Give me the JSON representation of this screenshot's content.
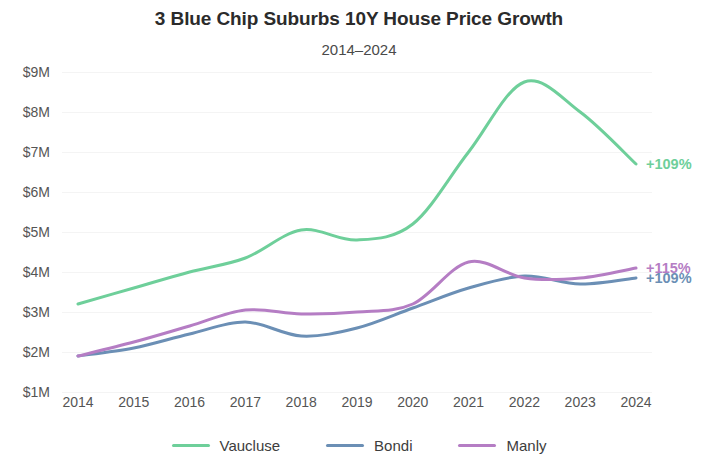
{
  "chart_data": {
    "type": "line",
    "title": "3 Blue Chip Suburbs 10Y House Price Growth",
    "subtitle": "2014–2024",
    "xlabel": "",
    "ylabel": "",
    "x": [
      2014,
      2015,
      2016,
      2017,
      2018,
      2019,
      2020,
      2021,
      2022,
      2023,
      2024
    ],
    "categories": [
      "2014",
      "2015",
      "2016",
      "2017",
      "2018",
      "2019",
      "2020",
      "2021",
      "2022",
      "2023",
      "2024"
    ],
    "ylim": [
      1,
      9
    ],
    "y_unit": "$M",
    "y_ticks": [
      9,
      8,
      7,
      6,
      5,
      4,
      3,
      2,
      1
    ],
    "y_tick_labels": [
      "$9M",
      "$8M",
      "$7M",
      "$6M",
      "$5M",
      "$4M",
      "$3M",
      "$2M",
      "$1M"
    ],
    "grid": true,
    "grid_color": "#f4f4f4",
    "legend_position": "bottom",
    "series": [
      {
        "name": "Vaucluse",
        "color": "#6ecf9a",
        "values": [
          3.2,
          3.6,
          4.0,
          4.35,
          5.05,
          4.8,
          5.2,
          7.0,
          8.75,
          8.0,
          6.7
        ],
        "end_label": "+109%"
      },
      {
        "name": "Bondi",
        "color": "#6b8fb5",
        "values": [
          1.9,
          2.1,
          2.45,
          2.75,
          2.4,
          2.6,
          3.1,
          3.6,
          3.9,
          3.7,
          3.85
        ],
        "end_label": "+109%"
      },
      {
        "name": "Manly",
        "color": "#b57dc4",
        "values": [
          1.9,
          2.25,
          2.65,
          3.05,
          2.95,
          3.0,
          3.2,
          4.25,
          3.85,
          3.85,
          4.1
        ],
        "end_label": "+115%"
      }
    ]
  },
  "legend": {
    "items": [
      {
        "label": "Vaucluse",
        "color": "#6ecf9a"
      },
      {
        "label": "Bondi",
        "color": "#6b8fb5"
      },
      {
        "label": "Manly",
        "color": "#b57dc4"
      }
    ]
  }
}
